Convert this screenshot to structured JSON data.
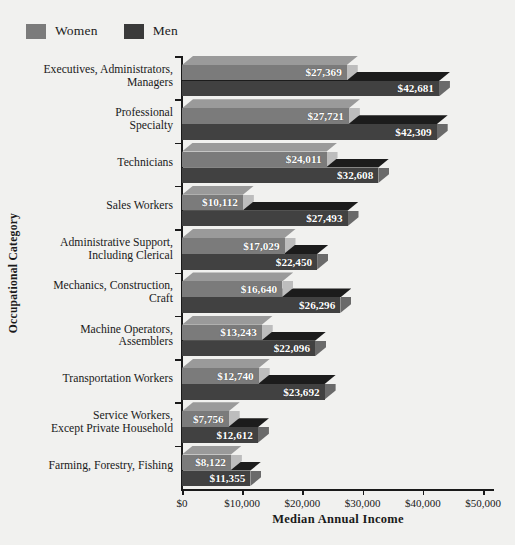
{
  "chart_data": {
    "type": "bar",
    "orientation": "horizontal",
    "title": "",
    "xlabel": "Median Annual Income",
    "ylabel": "Occupational Category",
    "xlim": [
      0,
      50000
    ],
    "xticks": [
      "$0",
      "$10,000",
      "$20,000",
      "$30,000",
      "$40,000",
      "$50,000"
    ],
    "xtick_values": [
      0,
      10000,
      20000,
      30000,
      40000,
      50000
    ],
    "grid": false,
    "legend_position": "top-left",
    "categories": [
      "Executives, Administrators, Managers",
      "Professional Specialty",
      "Technicians",
      "Sales Workers",
      "Administrative Support, Including Clerical",
      "Mechanics, Construction, Craft",
      "Machine Operators, Assemblers",
      "Transportation Workers",
      "Service Workers, Except Private Household",
      "Farming, Forestry, Fishing"
    ],
    "category_lines": [
      [
        "Executives, Administrators,",
        "Managers"
      ],
      [
        "Professional",
        "Specialty"
      ],
      [
        "Technicians"
      ],
      [
        "Sales Workers"
      ],
      [
        "Administrative Support,",
        "Including Clerical"
      ],
      [
        "Mechanics, Construction,",
        "Craft"
      ],
      [
        "Machine Operators,",
        "Assemblers"
      ],
      [
        "Transportation Workers"
      ],
      [
        "Service Workers,",
        "Except Private Household"
      ],
      [
        "Farming, Forestry, Fishing"
      ]
    ],
    "series": [
      {
        "name": "Women",
        "color": "#7b7b7b",
        "top_color": "#9a9a9a",
        "cap_color": "#bdbdbd",
        "values": [
          27369,
          27721,
          24011,
          10112,
          17029,
          16640,
          13243,
          12740,
          7756,
          8122
        ],
        "labels": [
          "$27,369",
          "$27,721",
          "$24,011",
          "$10,112",
          "$17,029",
          "$16,640",
          "$13,243",
          "$12,740",
          "$7,756",
          "$8,122"
        ]
      },
      {
        "name": "Men",
        "color": "#414141",
        "top_color": "#1c1c1c",
        "cap_color": "#6a6a6a",
        "values": [
          42681,
          42309,
          32608,
          27493,
          22450,
          26296,
          22096,
          23692,
          12612,
          11355
        ],
        "labels": [
          "$42,681",
          "$42,309",
          "$32,608",
          "$27,493",
          "$22,450",
          "$26,296",
          "$22,096",
          "$23,692",
          "$12,612",
          "$11,355"
        ]
      }
    ]
  },
  "legend": {
    "items": [
      {
        "label": "Women",
        "color": "#7b7b7b"
      },
      {
        "label": "Men",
        "color": "#3a3a3a"
      }
    ]
  },
  "axes": {
    "x_title": "Median Annual Income",
    "y_title": "Occupational Category"
  },
  "colors": {
    "background": "#f1f1ef",
    "axis": "#1a1a1a",
    "text": "#1a1a1a",
    "value_label": "#ffffff"
  }
}
